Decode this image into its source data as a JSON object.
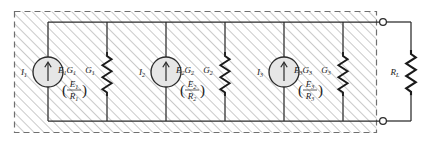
{
  "figure": {
    "type": "circuit-diagram",
    "colors": {
      "line": "#1a1a1a",
      "hatch": "#9a9a9a",
      "source_fill": "#e4e4e4",
      "background": "#ffffff"
    }
  },
  "enclosure": {
    "name": "source-network-box",
    "border_style": "dashed",
    "fill": "diagonal-hatch"
  },
  "stages": [
    {
      "current_label": "I",
      "current_sub": "1",
      "source_expr": "E",
      "source_expr_sub": "1",
      "source_expr2": "G",
      "source_expr2_sub": "1",
      "fraction_num": "E",
      "fraction_num_sub": "1",
      "fraction_den": "R",
      "fraction_den_sub": "1",
      "conductance": "G",
      "conductance_sub": "1",
      "symbol": "current-source-arrow-up"
    },
    {
      "current_label": "I",
      "current_sub": "2",
      "source_expr": "E",
      "source_expr_sub": "2",
      "source_expr2": "G",
      "source_expr2_sub": "2",
      "fraction_num": "E",
      "fraction_num_sub": "2",
      "fraction_den": "R",
      "fraction_den_sub": "2",
      "conductance": "G",
      "conductance_sub": "2",
      "symbol": "current-source-arrow-up"
    },
    {
      "current_label": "I",
      "current_sub": "3",
      "source_expr": "E",
      "source_expr_sub": "3",
      "source_expr2": "G",
      "source_expr2_sub": "3",
      "fraction_num": "E",
      "fraction_num_sub": "3",
      "fraction_den": "R",
      "fraction_den_sub": "3",
      "conductance": "G",
      "conductance_sub": "3",
      "symbol": "current-source-arrow-up"
    }
  ],
  "load": {
    "label": "R",
    "label_sub": "L",
    "symbol": "resistor-zigzag"
  },
  "terminals": [
    {
      "name": "terminal-top",
      "symbol": "open-circle"
    },
    {
      "name": "terminal-bottom",
      "symbol": "open-circle"
    }
  ]
}
